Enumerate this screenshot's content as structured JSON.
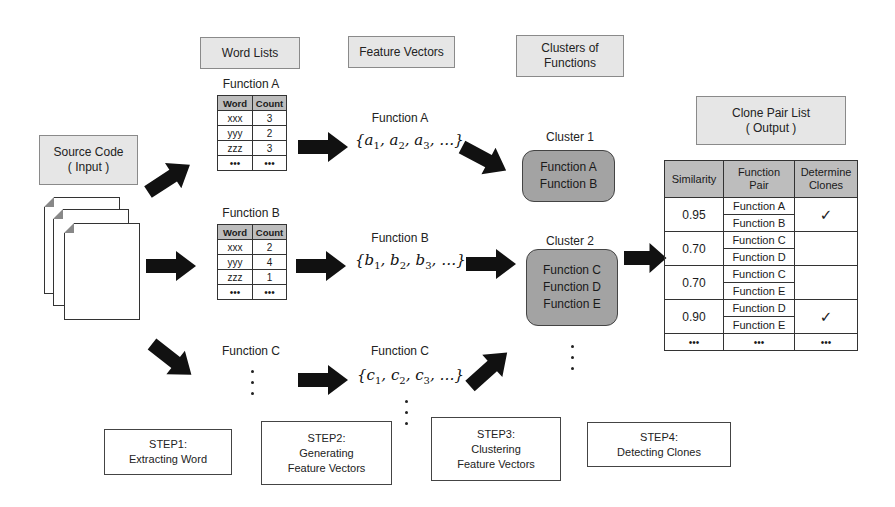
{
  "headers": {
    "word_lists": "Word Lists",
    "feature_vectors": "Feature Vectors",
    "clusters_line1": "Clusters of",
    "clusters_line2": "Functions",
    "source_line1": "Source Code",
    "source_line2": "( Input )",
    "clone_line1": "Clone Pair List",
    "clone_line2": "( Output )"
  },
  "word_lists": {
    "columns": [
      "Word",
      "Count"
    ],
    "function_a": {
      "title": "Function A",
      "rows": [
        [
          "xxx",
          "3"
        ],
        [
          "yyy",
          "2"
        ],
        [
          "zzz",
          "3"
        ],
        [
          "•••",
          "•••"
        ]
      ]
    },
    "function_b": {
      "title": "Function B",
      "rows": [
        [
          "xxx",
          "2"
        ],
        [
          "yyy",
          "4"
        ],
        [
          "zzz",
          "1"
        ],
        [
          "•••",
          "•••"
        ]
      ]
    },
    "function_c": {
      "title": "Function C"
    }
  },
  "feature_vectors": {
    "a": {
      "title": "Function A",
      "letter": "a"
    },
    "b": {
      "title": "Function B",
      "letter": "b"
    },
    "c": {
      "title": "Function C",
      "letter": "c"
    },
    "open": "{",
    "comma": ", ",
    "ellipsis": "…}",
    "subs": [
      "1",
      "2",
      "3"
    ]
  },
  "clusters": [
    {
      "title": "Cluster 1",
      "members": [
        "Function A",
        "Function B"
      ]
    },
    {
      "title": "Cluster 2",
      "members": [
        "Function C",
        "Function D",
        "Function E"
      ]
    }
  ],
  "clone_pair_table": {
    "headers": [
      "Similarity",
      "Function\nPair",
      "Determine\nClones"
    ],
    "header_similarity": "Similarity",
    "header_pair_1": "Function",
    "header_pair_2": "Pair",
    "header_det_1": "Determine",
    "header_det_2": "Clones",
    "rows": [
      {
        "similarity": "0.95",
        "pair": [
          "Function A",
          "Function B"
        ],
        "clone": "✓"
      },
      {
        "similarity": "0.70",
        "pair": [
          "Function C",
          "Function D"
        ],
        "clone": ""
      },
      {
        "similarity": "0.70",
        "pair": [
          "Function C",
          "Function E"
        ],
        "clone": ""
      },
      {
        "similarity": "0.90",
        "pair": [
          "Function D",
          "Function E"
        ],
        "clone": "✓"
      }
    ],
    "ellipsis": "•••"
  },
  "steps": [
    {
      "line1": "STEP1:",
      "line2": "Extracting Word",
      "line3": ""
    },
    {
      "line1": "STEP2:",
      "line2": "Generating",
      "line3": "Feature Vectors"
    },
    {
      "line1": "STEP3:",
      "line2": "Clustering",
      "line3": "Feature Vectors"
    },
    {
      "line1": "STEP4:",
      "line2": "Detecting Clones",
      "line3": ""
    }
  ],
  "colors": {
    "header_box": "#e6e6e6",
    "cluster_fill": "#a3a3a3",
    "table_header": "#bdbdbd",
    "arrow": "#111111"
  }
}
